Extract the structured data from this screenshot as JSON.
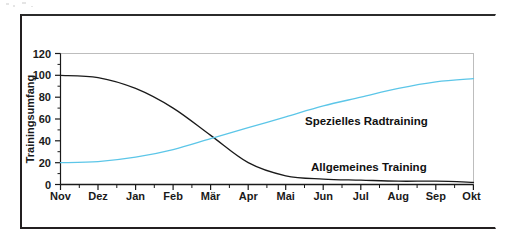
{
  "figure": {
    "background_color": "#ffffff",
    "frame_color": "#231f20",
    "plot_border_color": "#b8b8b8"
  },
  "chart_data": {
    "type": "line",
    "title": "",
    "subtitle": "",
    "xlabel": "",
    "ylabel": "Trainingsumfang",
    "categories": [
      "Nov",
      "Dez",
      "Jan",
      "Feb",
      "Mär",
      "Apr",
      "Mai",
      "Jun",
      "Jul",
      "Aug",
      "Sep",
      "Okt"
    ],
    "x_tick_labels": [
      "Nov",
      "Dez",
      "Jan",
      "Feb",
      "Mär",
      "Apr",
      "Mai",
      "Jun",
      "Jul",
      "Aug",
      "Sep",
      "Okt"
    ],
    "y_tick_labels": [
      "0",
      "20",
      "40",
      "60",
      "80",
      "100",
      "120"
    ],
    "y_ticks": [
      0,
      20,
      40,
      60,
      80,
      100,
      120
    ],
    "ylim": [
      0,
      120
    ],
    "xlim": [
      0,
      11
    ],
    "grid": false,
    "minor_ticks": true,
    "legend_position": "inline-annotations",
    "series": [
      {
        "name": "Allgemeines Training",
        "color": "#1a1a1a",
        "line_width": 1.3,
        "annotation_label": "Allgemeines Training",
        "values": [
          100,
          98,
          88,
          70,
          45,
          20,
          8,
          5,
          4,
          3,
          3,
          2
        ]
      },
      {
        "name": "Spezielles Radtraining",
        "color": "#5cc6e8",
        "line_width": 1.3,
        "annotation_label": "Spezielles Radtraining",
        "values": [
          20,
          21,
          25,
          32,
          42,
          52,
          62,
          72,
          80,
          88,
          94,
          97
        ]
      }
    ],
    "annotations": [
      {
        "text": "Spezielles Radtraining",
        "x_month": "Jun",
        "y_value": 44
      },
      {
        "text": "Allgemeines Training",
        "x_month": "Jul",
        "y_value": 13
      }
    ]
  }
}
